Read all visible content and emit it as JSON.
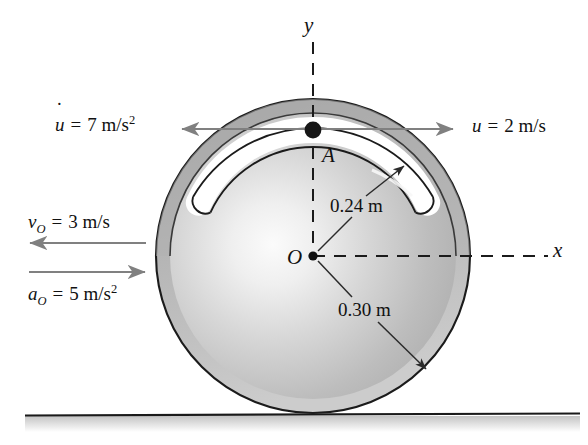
{
  "figure": {
    "background_color": "#ffffff",
    "ink_color": "#111111",
    "arrow_color": "#808080",
    "disk": {
      "center_label": "O",
      "center_x": 313,
      "center_y": 256,
      "outer_radius_px": 157,
      "outer_radius_label": "0.30 m",
      "groove_radius_px": 126,
      "groove_radius_label": "0.24 m",
      "groove_half_width_px": 13,
      "groove_start_angle_deg": 155,
      "groove_end_angle_deg": 25,
      "rim_band_color": "#a8a8a8",
      "face_light_color": "#f2f2f2",
      "face_mid_color": "#c9c9c9",
      "face_dark_color": "#9a9a9a",
      "groove_fill_color": "#ffffff"
    },
    "particle": {
      "label": "A",
      "x": 313,
      "y": 130,
      "radius_px": 8,
      "color": "#111111"
    },
    "axes": {
      "y_label": "y",
      "x_label": "x",
      "style": "dashed"
    },
    "ground": {
      "y": 415,
      "x_start": 25,
      "x_end": 580,
      "line_color": "#1a1a1a",
      "shadow_color": "#cfcfcf"
    }
  },
  "labels": {
    "u_dot": {
      "symbol": "u",
      "accent": "dot",
      "equals": "=",
      "value": "7",
      "unit": "m/s",
      "exponent": "2",
      "full_text": "u̇ = 7 m/s²"
    },
    "u": {
      "symbol": "u",
      "equals": "=",
      "value": "2",
      "unit": "m/s",
      "full_text": "u = 2 m/s"
    },
    "v_O": {
      "symbol": "v",
      "subscript": "O",
      "equals": "=",
      "value": "3",
      "unit": "m/s",
      "full_text": "v_O = 3 m/s"
    },
    "a_O": {
      "symbol": "a",
      "subscript": "O",
      "equals": "=",
      "value": "5",
      "unit": "m/s",
      "exponent": "2",
      "full_text": "a_O = 5 m/s²"
    },
    "radius_inner": "0.24 m",
    "radius_outer": "0.30 m",
    "axis_y": "y",
    "axis_x": "x",
    "point_A": "A",
    "point_O": "O"
  },
  "arrows": {
    "u_dot_arrow": {
      "direction": "left",
      "x_from": 455,
      "x_to": 180,
      "y": 129,
      "head": "start"
    },
    "u_arrow": {
      "direction": "right",
      "x_from": 180,
      "x_to": 455,
      "y": 129,
      "head": "end"
    },
    "v_O_arrow": {
      "direction": "left",
      "x_from": 145,
      "x_to": 28,
      "y": 243
    },
    "a_O_arrow": {
      "direction": "right",
      "x_from": 28,
      "x_to": 145,
      "y": 272
    },
    "leader_inner": {
      "from_x": 313,
      "from_y": 256,
      "to_x": 402,
      "to_y": 167,
      "head": "end"
    },
    "leader_outer": {
      "from_x": 313,
      "from_y": 256,
      "to_x": 424,
      "to_y": 367,
      "head": "end"
    }
  }
}
